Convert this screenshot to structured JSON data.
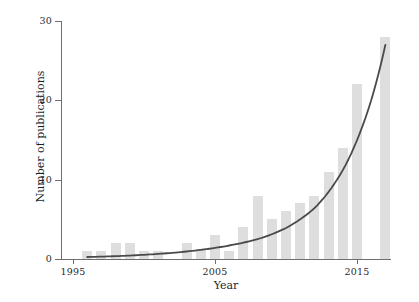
{
  "chart_data": {
    "type": "bar",
    "title": "",
    "subtitle": "",
    "xlabel": "Year",
    "ylabel": "Number of publications",
    "xlim": [
      1995.2,
      2018.0
    ],
    "ylim": [
      0,
      30
    ],
    "grid": false,
    "legend": null,
    "x_ticks": [
      1995,
      2005,
      2015
    ],
    "x_tick_labels": [
      "1995",
      "2005",
      "2015"
    ],
    "y_ticks": [
      0,
      10,
      20,
      30
    ],
    "y_tick_labels": [
      "0",
      "10",
      "20",
      "30"
    ],
    "categories": [
      1996,
      1997,
      1998,
      1999,
      2000,
      2001,
      2002,
      2003,
      2004,
      2005,
      2006,
      2007,
      2008,
      2009,
      2010,
      2011,
      2012,
      2013,
      2014,
      2015,
      2016,
      2017
    ],
    "series": [
      {
        "name": "Number of publications",
        "type": "bar",
        "color": "#dedede",
        "values": [
          1,
          1,
          2,
          2,
          1,
          1,
          0,
          2,
          1,
          3,
          1,
          4,
          8,
          5,
          6,
          7,
          8,
          11,
          14,
          22,
          0,
          28
        ]
      },
      {
        "name": "Exponential fit",
        "type": "line",
        "color": "#4a4a4a",
        "x": [
          1996,
          1998,
          2000,
          2002,
          2004,
          2006,
          2008,
          2010,
          2012,
          2014,
          2016,
          2017
        ],
        "values": [
          0.25,
          0.36,
          0.53,
          0.78,
          1.15,
          1.7,
          2.5,
          3.9,
          6.4,
          11.2,
          20.0,
          27.0
        ]
      }
    ],
    "annotations": []
  },
  "axes": {
    "y_title": "Number of publications",
    "x_title": "Year"
  },
  "colors": {
    "bar": "#dedede",
    "curve": "#4a4a4a",
    "axis": "#6e6e6e",
    "text": "#2b2b2b",
    "background": "#ffffff"
  }
}
